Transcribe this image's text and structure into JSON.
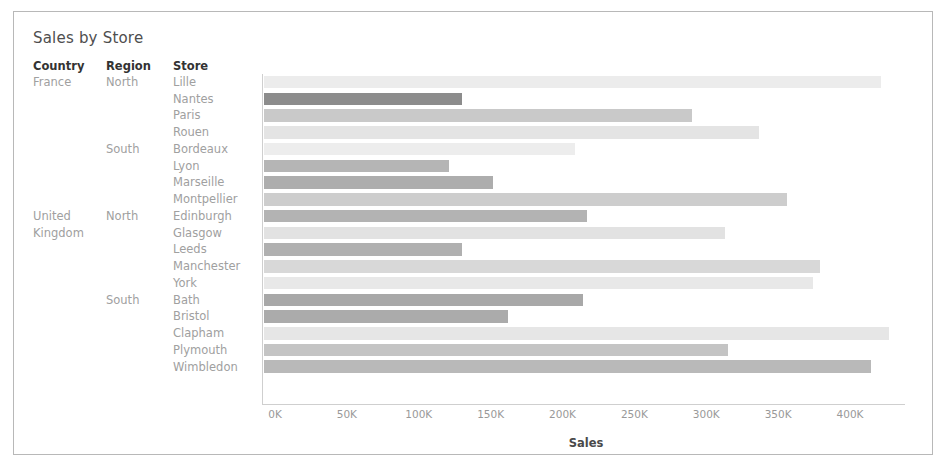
{
  "worksheet": {
    "title": "Sales by Store"
  },
  "row_headers": {
    "country": "Country",
    "region": "Region",
    "store": "Store"
  },
  "axis": {
    "title": "Sales",
    "tick_labels": [
      "0K",
      "50K",
      "100K",
      "150K",
      "200K",
      "250K",
      "300K",
      "350K",
      "400K"
    ],
    "tick_values": [
      0,
      50000,
      100000,
      150000,
      200000,
      250000,
      300000,
      350000,
      400000
    ],
    "min": 0,
    "max": 450000
  },
  "colors": {
    "frame_border": "#b8b8b8",
    "title_text": "#4e4e4e",
    "header_text": "#333333",
    "label_text": "#a0a0a0",
    "axis_line": "#cfcfcf",
    "tick_text": "#999999"
  },
  "rows": [
    {
      "country": "France",
      "region": "North",
      "store": "Lille",
      "value": 429000,
      "color": "#ececec"
    },
    {
      "country": "",
      "region": "",
      "store": "Nantes",
      "value": 138000,
      "color": "#8c8c8c"
    },
    {
      "country": "",
      "region": "",
      "store": "Paris",
      "value": 298000,
      "color": "#c9c9c9"
    },
    {
      "country": "",
      "region": "",
      "store": "Rouen",
      "value": 344000,
      "color": "#e4e4e4"
    },
    {
      "country": "",
      "region": "South",
      "store": "Bordeaux",
      "value": 216000,
      "color": "#ededed"
    },
    {
      "country": "",
      "region": "",
      "store": "Lyon",
      "value": 129000,
      "color": "#b5b5b5"
    },
    {
      "country": "",
      "region": "",
      "store": "Marseille",
      "value": 159000,
      "color": "#adadad"
    },
    {
      "country": "",
      "region": "",
      "store": "Montpellier",
      "value": 364000,
      "color": "#cdcdcd"
    },
    {
      "country": "United",
      "region": "North",
      "store": "Edinburgh",
      "value": 225000,
      "color": "#b3b3b3"
    },
    {
      "country": "Kingdom",
      "region": "",
      "store": "Glasgow",
      "value": 321000,
      "color": "#e2e2e2"
    },
    {
      "country": "",
      "region": "",
      "store": "Leeds",
      "value": 138000,
      "color": "#b0b0b0"
    },
    {
      "country": "",
      "region": "",
      "store": "Manchester",
      "value": 387000,
      "color": "#d8d8d8"
    },
    {
      "country": "",
      "region": "",
      "store": "York",
      "value": 382000,
      "color": "#e8e8e8"
    },
    {
      "country": "",
      "region": "South",
      "store": "Bath",
      "value": 222000,
      "color": "#a8a8a8"
    },
    {
      "country": "",
      "region": "",
      "store": "Bristol",
      "value": 170000,
      "color": "#ababab"
    },
    {
      "country": "",
      "region": "",
      "store": "Clapham",
      "value": 435000,
      "color": "#e6e6e6"
    },
    {
      "country": "",
      "region": "",
      "store": "Plymouth",
      "value": 323000,
      "color": "#c4c4c4"
    },
    {
      "country": "",
      "region": "",
      "store": "Wimbledon",
      "value": 422000,
      "color": "#b9b9b9"
    }
  ],
  "chart_data": {
    "type": "bar",
    "orientation": "horizontal",
    "title": "Sales by Store",
    "xlabel": "Sales",
    "ylabel": "",
    "xlim": [
      0,
      450000
    ],
    "grid": false,
    "legend": "none",
    "categories": [
      "Lille",
      "Nantes",
      "Paris",
      "Rouen",
      "Bordeaux",
      "Lyon",
      "Marseille",
      "Montpellier",
      "Edinburgh",
      "Glasgow",
      "Leeds",
      "Manchester",
      "York",
      "Bath",
      "Bristol",
      "Clapham",
      "Plymouth",
      "Wimbledon"
    ],
    "values": [
      429000,
      138000,
      298000,
      344000,
      216000,
      129000,
      159000,
      364000,
      225000,
      321000,
      138000,
      387000,
      382000,
      222000,
      170000,
      435000,
      323000,
      422000
    ],
    "group_country": [
      "France",
      "France",
      "France",
      "France",
      "France",
      "France",
      "France",
      "France",
      "United Kingdom",
      "United Kingdom",
      "United Kingdom",
      "United Kingdom",
      "United Kingdom",
      "United Kingdom",
      "United Kingdom",
      "United Kingdom",
      "United Kingdom",
      "United Kingdom"
    ],
    "group_region": [
      "North",
      "North",
      "North",
      "North",
      "South",
      "South",
      "South",
      "South",
      "North",
      "North",
      "North",
      "North",
      "North",
      "South",
      "South",
      "South",
      "South",
      "South"
    ],
    "xtick_labels": [
      "0K",
      "50K",
      "100K",
      "150K",
      "200K",
      "250K",
      "300K",
      "350K",
      "400K"
    ],
    "xticks": [
      0,
      50000,
      100000,
      150000,
      200000,
      250000,
      300000,
      350000,
      400000
    ]
  }
}
